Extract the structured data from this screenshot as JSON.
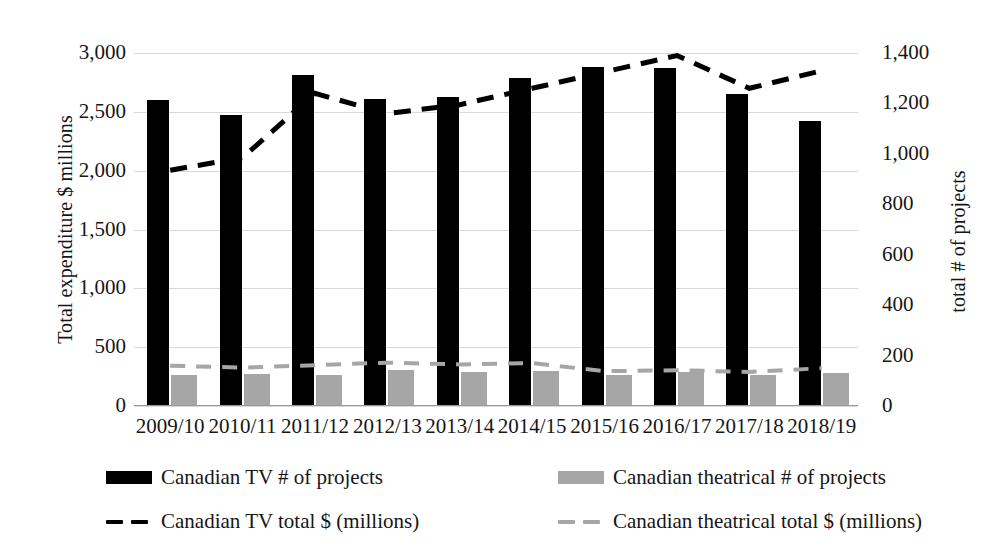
{
  "chart_data": {
    "type": "bar",
    "title": "",
    "subtitle": "",
    "categories": [
      "2009/10",
      "2010/11",
      "2011/12",
      "2012/13",
      "2013/14",
      "2014/15",
      "2015/16",
      "2016/17",
      "2017/18",
      "2018/19"
    ],
    "xlabel": "",
    "grid": true,
    "legend_position": "bottom",
    "axes": {
      "left": {
        "label": "Total expenditure $ millions",
        "ticks": [
          "0",
          "500",
          "1,000",
          "1,500",
          "2,000",
          "2,500",
          "3,000"
        ],
        "tick_values": [
          0,
          500,
          1000,
          1500,
          2000,
          2500,
          3000
        ],
        "ylim": [
          0,
          3000
        ]
      },
      "right": {
        "label": "total # of projects",
        "ticks": [
          "0",
          "200",
          "400",
          "600",
          "800",
          "1,000",
          "1,200",
          "1,400"
        ],
        "tick_values": [
          0,
          200,
          400,
          600,
          800,
          1000,
          1200,
          1400
        ],
        "ylim": [
          0,
          1400
        ]
      }
    },
    "series": [
      {
        "name": "Canadian TV # of projects",
        "kind": "bar",
        "axis": "left",
        "color": "#000000",
        "values": [
          2600,
          2470,
          2810,
          2610,
          2630,
          2790,
          2880,
          2870,
          2655,
          2420
        ]
      },
      {
        "name": "Canadian theatrical # of projects",
        "kind": "bar",
        "axis": "left",
        "color": "#a6a6a6",
        "values": [
          265,
          270,
          265,
          310,
          285,
          300,
          265,
          285,
          265,
          280
        ]
      },
      {
        "name": "Canadian TV total $ (millions)",
        "kind": "line-dashed",
        "axis": "right",
        "color": "#000000",
        "values": [
          935,
          985,
          1240,
          1160,
          1195,
          1260,
          1325,
          1390,
          1260,
          1330
        ]
      },
      {
        "name": "Canadian theatrical total $ (millions)",
        "kind": "line-dashed",
        "axis": "right",
        "color": "#a6a6a6",
        "values": [
          160,
          152,
          162,
          172,
          165,
          170,
          138,
          142,
          135,
          150
        ]
      }
    ]
  },
  "legend": {
    "entries": [
      {
        "label": "Canadian TV # of projects",
        "marker": "solid-box",
        "color": "#000000"
      },
      {
        "label": "Canadian theatrical # of projects",
        "marker": "solid-box",
        "color": "#a6a6a6"
      },
      {
        "label": "Canadian TV total $ (millions)",
        "marker": "dashed-line",
        "color": "#000000"
      },
      {
        "label": "Canadian theatrical total $ (millions)",
        "marker": "dashed-line",
        "color": "#a6a6a6"
      }
    ]
  }
}
